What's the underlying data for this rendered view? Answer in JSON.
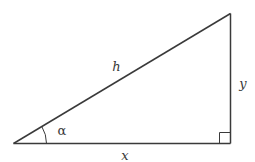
{
  "diagram": {
    "labels": {
      "hypotenuse": "h",
      "opposite": "y",
      "adjacent": "x",
      "angle": "α"
    },
    "vertices": {
      "left": [
        13.5,
        143.5
      ],
      "right_angle": [
        230.5,
        143.5
      ],
      "top": [
        230.5,
        13.5
      ]
    },
    "colors": {
      "stroke": "#3a3a3a",
      "background": "#ffffff"
    }
  }
}
